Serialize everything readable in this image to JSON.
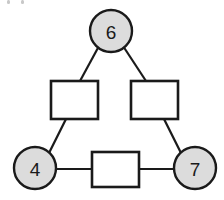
{
  "diagram": {
    "background_color": "#ffffff",
    "stroke_color": "#1a1a1a",
    "circle_fill": "#dcdcdc",
    "square_fill": "#ffffff",
    "circle_nodes": [
      {
        "id": "node-top",
        "label": "6",
        "cx": 111,
        "cy": 31,
        "r": 21
      },
      {
        "id": "node-bottom-left",
        "label": "4",
        "cx": 35,
        "cy": 168,
        "r": 21
      },
      {
        "id": "node-bottom-right",
        "label": "7",
        "cx": 195,
        "cy": 168,
        "r": 21
      }
    ],
    "square_nodes": [
      {
        "id": "box-left",
        "label": "",
        "x": 51,
        "y": 81,
        "width": 47,
        "height": 38
      },
      {
        "id": "box-right",
        "label": "",
        "x": 131,
        "y": 81,
        "width": 47,
        "height": 38
      },
      {
        "id": "box-bottom",
        "label": "",
        "x": 92,
        "y": 152,
        "width": 47,
        "height": 35
      }
    ],
    "edges": [
      {
        "id": "edge-top-to-box-left",
        "from": "node-top",
        "to": "box-left",
        "x1": 99,
        "y1": 46,
        "x2": 80,
        "y2": 81
      },
      {
        "id": "edge-top-to-box-right",
        "from": "node-top",
        "to": "box-right",
        "x1": 123,
        "y1": 46,
        "x2": 146,
        "y2": 81
      },
      {
        "id": "edge-box-left-to-bl",
        "from": "box-left",
        "to": "node-bottom-left",
        "x1": 66,
        "y1": 119,
        "x2": 49,
        "y2": 153
      },
      {
        "id": "edge-box-right-to-br",
        "from": "box-right",
        "to": "node-bottom-right",
        "x1": 164,
        "y1": 119,
        "x2": 181,
        "y2": 153
      },
      {
        "id": "edge-bl-to-box-bottom",
        "from": "node-bottom-left",
        "to": "box-bottom",
        "x1": 56,
        "y1": 169,
        "x2": 92,
        "y2": 169
      },
      {
        "id": "edge-box-bottom-to-br",
        "from": "box-bottom",
        "to": "node-bottom-right",
        "x1": 139,
        "y1": 169,
        "x2": 174,
        "y2": 169
      }
    ],
    "crop_artifacts": [
      {
        "id": "artifact-left",
        "x": 7,
        "y": 0,
        "width": 3,
        "height": 4
      },
      {
        "id": "artifact-right",
        "x": 21,
        "y": 0,
        "width": 3,
        "height": 4
      }
    ]
  }
}
